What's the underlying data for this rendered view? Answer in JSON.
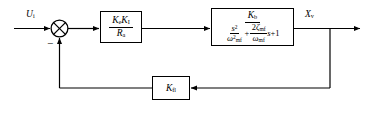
{
  "diagram": {
    "signals": {
      "input": {
        "symbol": "U",
        "subscript": "i"
      },
      "output": {
        "symbol": "X",
        "subscript": "v"
      },
      "sum_sign": "−"
    },
    "blocks": [
      {
        "id": "gain1",
        "type": "transfer-function",
        "numerator": {
          "symbol1": "K",
          "sub1": "e",
          "symbol2": "K",
          "sub2": "I"
        },
        "denominator": {
          "symbol": "R",
          "sub": "a"
        }
      },
      {
        "id": "plant",
        "type": "second-order-transfer-function",
        "numerator": {
          "symbol": "K",
          "sub": "b"
        },
        "denominator": {
          "term1": {
            "num_var": "s",
            "num_pow": "2",
            "den_var": "ω",
            "den_sub": "mf",
            "den_pow": "2"
          },
          "operator": "+",
          "term2": {
            "num_coeff": "2",
            "num_var": "ζ",
            "num_sub": "mf",
            "den_var": "ω",
            "den_sub": "mf",
            "mult_var": "s"
          },
          "constant": "+1"
        }
      },
      {
        "id": "feedback",
        "type": "gain",
        "label": {
          "symbol": "K",
          "sub": "fl"
        }
      }
    ],
    "colors": {
      "line": "#000000",
      "background": "#ffffff",
      "block_fill": "#ffffff"
    }
  }
}
